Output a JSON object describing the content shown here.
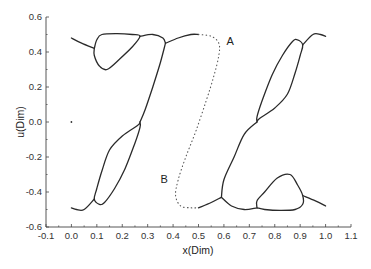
{
  "chart_data": {
    "type": "line",
    "title": "",
    "xlabel": "x(Dim)",
    "ylabel": "u(Dim)",
    "xlim": [
      -0.1,
      1.1
    ],
    "ylim": [
      -0.6,
      0.6
    ],
    "xticks": [
      "-0.1",
      "0.0",
      "0.1",
      "0.2",
      "0.3",
      "0.4",
      "0.5",
      "0.6",
      "0.7",
      "0.8",
      "0.9",
      "1.0",
      "1.1"
    ],
    "yticks": [
      "-0.6",
      "-0.4",
      "-0.2",
      "0.0",
      "0.2",
      "0.4",
      "0.6"
    ],
    "grid": false,
    "legend": null,
    "annotations": [
      {
        "text": "A",
        "x": 0.61,
        "y": 0.44
      },
      {
        "text": "B",
        "x": 0.35,
        "y": -0.35
      }
    ],
    "series": [
      {
        "name": "left-top-tail",
        "style": "solid",
        "points": [
          [
            0.0,
            0.48
          ],
          [
            0.04,
            0.45
          ],
          [
            0.09,
            0.42
          ]
        ]
      },
      {
        "name": "left-top-loop",
        "style": "solid",
        "points": [
          [
            0.09,
            0.42
          ],
          [
            0.1,
            0.47
          ],
          [
            0.12,
            0.5
          ],
          [
            0.18,
            0.505
          ],
          [
            0.24,
            0.5
          ],
          [
            0.27,
            0.49
          ],
          [
            0.24,
            0.43
          ],
          [
            0.19,
            0.36
          ],
          [
            0.14,
            0.3
          ],
          [
            0.11,
            0.32
          ],
          [
            0.09,
            0.38
          ],
          [
            0.09,
            0.42
          ]
        ]
      },
      {
        "name": "top-bridge",
        "style": "solid",
        "points": [
          [
            0.27,
            0.49
          ],
          [
            0.32,
            0.5
          ],
          [
            0.36,
            0.48
          ],
          [
            0.37,
            0.45
          ]
        ]
      },
      {
        "name": "A-branch",
        "style": "solid",
        "points": [
          [
            0.37,
            0.45
          ],
          [
            0.42,
            0.48
          ],
          [
            0.47,
            0.5
          ],
          [
            0.5,
            0.5
          ]
        ]
      },
      {
        "name": "A-dotted",
        "style": "dotted",
        "points": [
          [
            0.5,
            0.5
          ],
          [
            0.55,
            0.49
          ],
          [
            0.58,
            0.45
          ],
          [
            0.58,
            0.38
          ],
          [
            0.56,
            0.26
          ],
          [
            0.53,
            0.12
          ],
          [
            0.49,
            -0.05
          ],
          [
            0.45,
            -0.2
          ],
          [
            0.42,
            -0.33
          ],
          [
            0.41,
            -0.42
          ],
          [
            0.43,
            -0.48
          ],
          [
            0.47,
            -0.49
          ],
          [
            0.5,
            -0.49
          ]
        ]
      },
      {
        "name": "B-branch",
        "style": "solid",
        "points": [
          [
            0.5,
            -0.49
          ],
          [
            0.55,
            -0.46
          ],
          [
            0.59,
            -0.43
          ]
        ]
      },
      {
        "name": "left-descending",
        "style": "solid",
        "points": [
          [
            0.37,
            0.45
          ],
          [
            0.35,
            0.34
          ],
          [
            0.32,
            0.2
          ],
          [
            0.29,
            0.07
          ],
          [
            0.27,
            0.0
          ]
        ]
      },
      {
        "name": "left-bottom-loop",
        "style": "solid",
        "points": [
          [
            0.27,
            0.0
          ],
          [
            0.26,
            -0.02
          ],
          [
            0.2,
            -0.08
          ],
          [
            0.15,
            -0.16
          ],
          [
            0.12,
            -0.28
          ],
          [
            0.1,
            -0.38
          ],
          [
            0.09,
            -0.44
          ],
          [
            0.11,
            -0.47
          ],
          [
            0.13,
            -0.46
          ],
          [
            0.17,
            -0.38
          ],
          [
            0.21,
            -0.27
          ],
          [
            0.25,
            -0.12
          ],
          [
            0.27,
            -0.03
          ],
          [
            0.27,
            0.0
          ]
        ]
      },
      {
        "name": "left-bottom-tail",
        "style": "solid",
        "points": [
          [
            0.09,
            -0.44
          ],
          [
            0.05,
            -0.5
          ],
          [
            0.02,
            -0.5
          ],
          [
            0.0,
            -0.49
          ]
        ]
      },
      {
        "name": "right-ascending",
        "style": "solid",
        "points": [
          [
            0.59,
            -0.43
          ],
          [
            0.6,
            -0.33
          ],
          [
            0.64,
            -0.2
          ],
          [
            0.68,
            -0.07
          ],
          [
            0.73,
            0.0
          ]
        ]
      },
      {
        "name": "right-top-loop",
        "style": "solid",
        "points": [
          [
            0.73,
            0.0
          ],
          [
            0.74,
            0.02
          ],
          [
            0.8,
            0.08
          ],
          [
            0.85,
            0.16
          ],
          [
            0.88,
            0.28
          ],
          [
            0.9,
            0.38
          ],
          [
            0.91,
            0.44
          ],
          [
            0.89,
            0.47
          ],
          [
            0.87,
            0.46
          ],
          [
            0.83,
            0.38
          ],
          [
            0.79,
            0.27
          ],
          [
            0.75,
            0.12
          ],
          [
            0.73,
            0.03
          ],
          [
            0.73,
            0.0
          ]
        ]
      },
      {
        "name": "right-top-tail",
        "style": "solid",
        "points": [
          [
            0.91,
            0.44
          ],
          [
            0.95,
            0.5
          ],
          [
            0.98,
            0.5
          ],
          [
            1.0,
            0.49
          ]
        ]
      },
      {
        "name": "bottom-bridge",
        "style": "solid",
        "points": [
          [
            0.59,
            -0.43
          ],
          [
            0.63,
            -0.48
          ],
          [
            0.68,
            -0.5
          ],
          [
            0.73,
            -0.49
          ]
        ]
      },
      {
        "name": "right-bottom-loop",
        "style": "solid",
        "points": [
          [
            0.73,
            -0.49
          ],
          [
            0.76,
            -0.5
          ],
          [
            0.82,
            -0.505
          ],
          [
            0.88,
            -0.5
          ],
          [
            0.91,
            -0.47
          ],
          [
            0.91,
            -0.42
          ],
          [
            0.89,
            -0.36
          ],
          [
            0.86,
            -0.3
          ],
          [
            0.81,
            -0.32
          ],
          [
            0.76,
            -0.4
          ],
          [
            0.73,
            -0.45
          ],
          [
            0.73,
            -0.49
          ]
        ]
      },
      {
        "name": "right-bottom-tail",
        "style": "solid",
        "points": [
          [
            0.91,
            -0.42
          ],
          [
            0.96,
            -0.45
          ],
          [
            1.0,
            -0.48
          ]
        ]
      },
      {
        "name": "isolated-point",
        "style": "marker",
        "points": [
          [
            0.0,
            0.0
          ]
        ]
      }
    ]
  }
}
